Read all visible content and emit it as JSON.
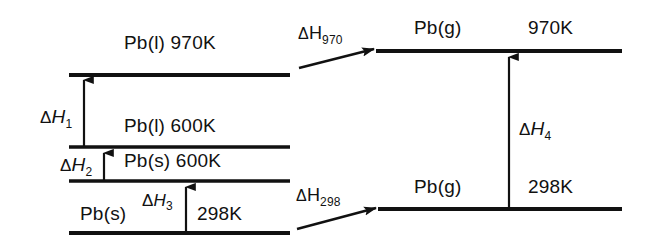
{
  "diagram": {
    "ink_color": "#111111",
    "background_color": "#ffffff",
    "left_column": {
      "levels": [
        {
          "id": "pb-l-970",
          "species": "Pb",
          "phase": "(l)",
          "temperature": "970K",
          "label": "Pb(l) 970K"
        },
        {
          "id": "pb-l-600",
          "species": "Pb",
          "phase": "(l)",
          "temperature": "600K",
          "label": "Pb(l) 600K"
        },
        {
          "id": "pb-s-600",
          "species": "Pb",
          "phase": "(s)",
          "temperature": "600K",
          "label": "Pb(s) 600K"
        },
        {
          "id": "pb-s-298",
          "species": "Pb",
          "phase": "(s)",
          "temperature": "298K",
          "label": "Pb(s) 298K"
        }
      ],
      "arrows": [
        {
          "id": "dH1",
          "symbol": "ΔH",
          "subscript": "1",
          "label": "ΔH₁",
          "from_level": "pb-l-600",
          "to_level": "pb-l-970",
          "direction": "up"
        },
        {
          "id": "dH2",
          "symbol": "ΔH",
          "subscript": "2",
          "label": "ΔH₂",
          "from_level": "pb-s-600",
          "to_level": "pb-l-600",
          "direction": "up"
        },
        {
          "id": "dH3",
          "symbol": "ΔH",
          "subscript": "3",
          "label": "ΔH₃",
          "from_level": "pb-s-298",
          "to_level": "pb-s-600",
          "direction": "up"
        }
      ]
    },
    "right_column": {
      "levels": [
        {
          "id": "pb-g-970",
          "species": "Pb",
          "phase": "(g)",
          "temperature": "970K",
          "species_label": "Pb(g)",
          "temperature_label": "970K"
        },
        {
          "id": "pb-g-298",
          "species": "Pb",
          "phase": "(g)",
          "temperature": "298K",
          "species_label": "Pb(g)",
          "temperature_label": "298K"
        }
      ],
      "arrows": [
        {
          "id": "dH4",
          "symbol": "ΔH",
          "subscript": "4",
          "label": "ΔH₄",
          "from_level": "pb-g-298",
          "to_level": "pb-g-970",
          "direction": "up"
        }
      ]
    },
    "cross_arrows": [
      {
        "id": "dH970",
        "symbol": "ΔH",
        "subscript": "970",
        "label": "ΔH₉₇₀",
        "from_level": "pb-l-970",
        "to_level": "pb-g-970",
        "direction": "right"
      },
      {
        "id": "dH298",
        "symbol": "ΔH",
        "subscript": "298",
        "label": "ΔH₂₉₈",
        "from_level": "pb-s-298",
        "to_level": "pb-g-298",
        "direction": "right"
      }
    ]
  }
}
